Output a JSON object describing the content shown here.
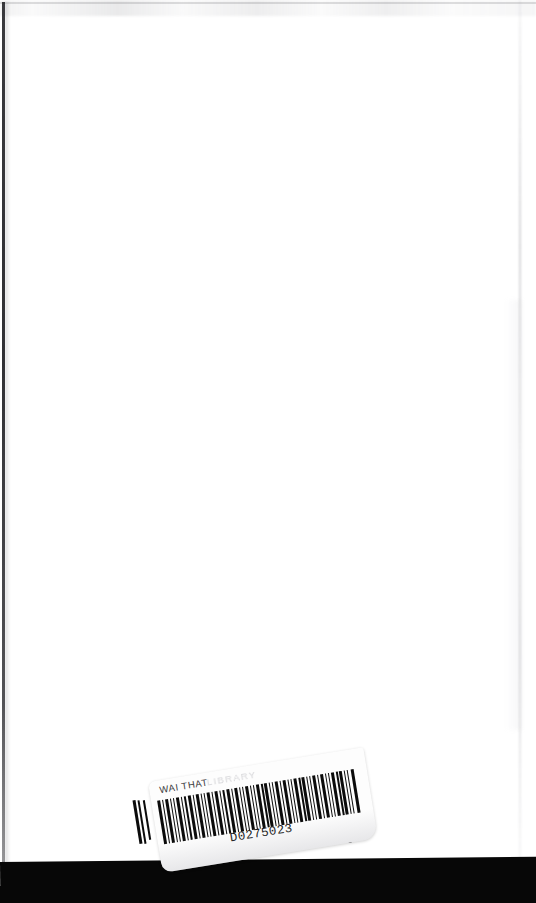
{
  "document": {
    "type": "scanned-book-page",
    "description": "Blank white book page (inside back cover) with a tilted library barcode label near the bottom",
    "page_background": "#ffffff",
    "bottom_band_color": "#070707",
    "ink_color": "#0b0b0b"
  },
  "label": {
    "title": "WAI THAT",
    "title_faded": "LIBRARY",
    "barcode_number": "D0275023",
    "background": "#fdfdfd",
    "rotation_degrees": -9.2,
    "bars": [
      {
        "x": 0,
        "w": 3.0
      },
      {
        "x": 5,
        "w": 1.4
      },
      {
        "x": 8,
        "w": 3.2
      },
      {
        "x": 13,
        "w": 1.3
      },
      {
        "x": 16,
        "w": 1.4
      },
      {
        "x": 19,
        "w": 3.0
      },
      {
        "x": 24,
        "w": 1.3
      },
      {
        "x": 27,
        "w": 1.5
      },
      {
        "x": 31,
        "w": 3.1
      },
      {
        "x": 36,
        "w": 1.3
      },
      {
        "x": 39,
        "w": 3.0
      },
      {
        "x": 44,
        "w": 1.4
      },
      {
        "x": 47,
        "w": 1.3
      },
      {
        "x": 50,
        "w": 3.2
      },
      {
        "x": 55,
        "w": 1.4
      },
      {
        "x": 58,
        "w": 3.0
      },
      {
        "x": 63,
        "w": 1.3
      },
      {
        "x": 66,
        "w": 1.5
      },
      {
        "x": 70,
        "w": 3.1
      },
      {
        "x": 75,
        "w": 1.3
      },
      {
        "x": 78,
        "w": 3.0
      },
      {
        "x": 83,
        "w": 1.4
      },
      {
        "x": 86,
        "w": 1.3
      },
      {
        "x": 89,
        "w": 3.2
      },
      {
        "x": 94,
        "w": 1.4
      },
      {
        "x": 97,
        "w": 1.3
      },
      {
        "x": 100,
        "w": 3.0
      },
      {
        "x": 105,
        "w": 1.5
      },
      {
        "x": 108,
        "w": 3.1
      },
      {
        "x": 113,
        "w": 1.3
      },
      {
        "x": 116,
        "w": 1.4
      },
      {
        "x": 119,
        "w": 3.0
      },
      {
        "x": 124,
        "w": 1.3
      },
      {
        "x": 127,
        "w": 3.2
      },
      {
        "x": 132,
        "w": 1.4
      },
      {
        "x": 135,
        "w": 1.3
      },
      {
        "x": 138,
        "w": 3.0
      },
      {
        "x": 143,
        "w": 1.5
      },
      {
        "x": 146,
        "w": 3.1
      },
      {
        "x": 151,
        "w": 1.3
      },
      {
        "x": 154,
        "w": 1.4
      },
      {
        "x": 157,
        "w": 3.0
      },
      {
        "x": 162,
        "w": 1.3
      },
      {
        "x": 165,
        "w": 3.2
      },
      {
        "x": 170,
        "w": 1.4
      },
      {
        "x": 173,
        "w": 1.3
      },
      {
        "x": 176,
        "w": 3.0
      },
      {
        "x": 181,
        "w": 1.5
      },
      {
        "x": 184,
        "w": 3.1
      },
      {
        "x": 189,
        "w": 1.3
      },
      {
        "x": 192,
        "w": 1.4
      },
      {
        "x": 196,
        "w": 3.0
      }
    ]
  },
  "stray_bars": {
    "left": [
      {
        "x": 136,
        "w": 3.0,
        "h": 44
      },
      {
        "x": 141,
        "w": 2.4,
        "h": 44
      },
      {
        "x": 146,
        "w": 2.0,
        "h": 40
      }
    ],
    "right": [
      {
        "x": 340,
        "w": 2.0,
        "h": 42
      },
      {
        "x": 345,
        "w": 3.2,
        "h": 46
      }
    ]
  }
}
